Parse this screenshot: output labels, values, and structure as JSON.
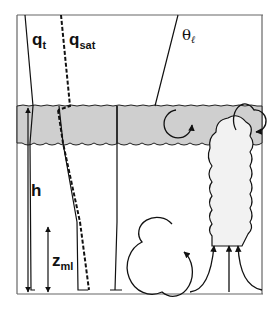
{
  "diagram": {
    "type": "boundary-layer-schematic",
    "colors": {
      "background": "#ffffff",
      "frame": "#555555",
      "line": "#111111",
      "cloud_layer_fill": "#cfcfcf",
      "cumulus_fill": "#f0f0f0"
    },
    "labels": {
      "qt": {
        "main": "q",
        "sub": "t"
      },
      "qsat": {
        "main": "q",
        "sub": "sat"
      },
      "theta_l": {
        "main": "θ",
        "sub": "ℓ"
      },
      "h": {
        "main": "h"
      },
      "zml": {
        "main": "z",
        "sub": "ml"
      }
    },
    "profiles": [
      {
        "name": "qt",
        "style": "solid"
      },
      {
        "name": "qsat",
        "style": "dashed"
      },
      {
        "name": "theta_l",
        "style": "solid"
      }
    ],
    "features": [
      "stratocumulus cloud layer (shaded band)",
      "circulation eddy within cloud layer",
      "cumulus tower rising through cloud layer",
      "circulation eddy in sub-cloud layer",
      "converging updraft arrows feeding cumulus base",
      "boundary layer depth arrow h",
      "mixed layer depth arrow z_ml"
    ]
  }
}
